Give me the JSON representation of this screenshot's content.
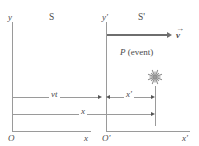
{
  "figure": {
    "frames": {
      "left": {
        "name": "S",
        "y_axis_label": "y",
        "x_axis_label": "x",
        "origin_label": "O"
      },
      "right": {
        "name": "S'",
        "y_axis_label": "y'",
        "x_axis_label": "x'",
        "origin_label": "O'"
      }
    },
    "velocity": {
      "label": "v",
      "accent": "→",
      "description": "velocity vector arrow pointing right"
    },
    "event": {
      "label": "P",
      "qualifier": "(event)",
      "marker": "starburst-icon"
    },
    "measurements": [
      {
        "name": "vt",
        "label": "vt",
        "from": "O",
        "to": "O'"
      },
      {
        "name": "x-prime",
        "label": "x'",
        "from": "O'",
        "to": "P"
      },
      {
        "name": "x",
        "label": "x",
        "from": "O",
        "to": "P"
      }
    ],
    "colors": {
      "axis": "#9a9a9a",
      "arrow": "#6e6e6e",
      "text": "#4a4a4a",
      "burst": "#8d8d8d",
      "background": "#ffffff"
    }
  }
}
